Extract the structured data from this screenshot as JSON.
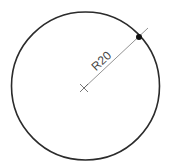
{
  "diagram": {
    "type": "circle-radius-dimension",
    "circle": {
      "cx": 85.5,
      "cy": 86,
      "r": 74,
      "stroke": "#2b2b2b",
      "stroke_width": 1.6
    },
    "center_mark": {
      "x": 84,
      "y": 88,
      "size": 4,
      "stroke": "#555555"
    },
    "radius_line": {
      "x1": 84,
      "y1": 88,
      "x2": 148,
      "y2": 28,
      "stroke": "#777777",
      "stroke_width": 0.8
    },
    "endpoint_dot": {
      "x": 139,
      "y": 37,
      "r": 3,
      "fill": "#111111"
    },
    "dimension_label": {
      "text": "R20",
      "x": 104,
      "y": 64,
      "angle": -43
    }
  }
}
